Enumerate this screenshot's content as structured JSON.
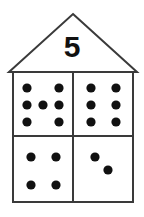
{
  "figure": {
    "type": "number-house-dot-diagram",
    "roof_number": "5",
    "stroke_color": "#3a3a3a",
    "dot_color": "#111111",
    "background_color": "#ffffff",
    "outline": {
      "apex": [
        73,
        14
      ],
      "roof_left": [
        9,
        71
      ],
      "roof_right": [
        137,
        71
      ],
      "body_left": 13,
      "body_right": 133,
      "body_top": 72,
      "body_bottom": 202,
      "divider_x": 73,
      "divider_y": 136
    },
    "quadrants": [
      {
        "name": "top-left",
        "dot_count": 7,
        "dots": [
          [
            27,
            88
          ],
          [
            59,
            88
          ],
          [
            27,
            105
          ],
          [
            43,
            105
          ],
          [
            59,
            105
          ],
          [
            27,
            122
          ],
          [
            59,
            122
          ]
        ]
      },
      {
        "name": "top-right",
        "dot_count": 6,
        "dots": [
          [
            91,
            88
          ],
          [
            116,
            88
          ],
          [
            91,
            105
          ],
          [
            116,
            105
          ],
          [
            91,
            122
          ],
          [
            116,
            122
          ]
        ]
      },
      {
        "name": "bottom-left",
        "dot_count": 4,
        "dots": [
          [
            31,
            157
          ],
          [
            56,
            157
          ],
          [
            31,
            185
          ],
          [
            56,
            185
          ]
        ]
      },
      {
        "name": "bottom-right",
        "dot_count": 2,
        "dots": [
          [
            95,
            157
          ],
          [
            108,
            170
          ]
        ]
      }
    ],
    "dot_radius": 4.6,
    "total_dots": 19
  }
}
